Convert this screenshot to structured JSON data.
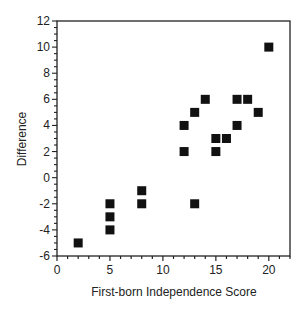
{
  "chart_data": {
    "type": "scatter",
    "title": "",
    "xlabel": "First-born Independence Score",
    "ylabel": "Difference",
    "xlim": [
      0,
      22
    ],
    "ylim": [
      -6,
      12
    ],
    "xticks": [
      0,
      5,
      10,
      15,
      20
    ],
    "yticks": [
      -6,
      -4,
      -2,
      0,
      2,
      4,
      6,
      8,
      10,
      12
    ],
    "grid": false,
    "legend": null,
    "marker": "square",
    "marker_color": "#111111",
    "points": [
      {
        "x": 2,
        "y": -5
      },
      {
        "x": 5,
        "y": -2
      },
      {
        "x": 5,
        "y": -3
      },
      {
        "x": 5,
        "y": -4
      },
      {
        "x": 8,
        "y": -1
      },
      {
        "x": 8,
        "y": -2
      },
      {
        "x": 12,
        "y": 4
      },
      {
        "x": 12,
        "y": 2
      },
      {
        "x": 13,
        "y": 5
      },
      {
        "x": 13,
        "y": -2
      },
      {
        "x": 14,
        "y": 6
      },
      {
        "x": 15,
        "y": 3
      },
      {
        "x": 15,
        "y": 2
      },
      {
        "x": 16,
        "y": 3
      },
      {
        "x": 17,
        "y": 6
      },
      {
        "x": 17,
        "y": 4
      },
      {
        "x": 18,
        "y": 6
      },
      {
        "x": 19,
        "y": 5
      },
      {
        "x": 20,
        "y": 10
      }
    ]
  }
}
